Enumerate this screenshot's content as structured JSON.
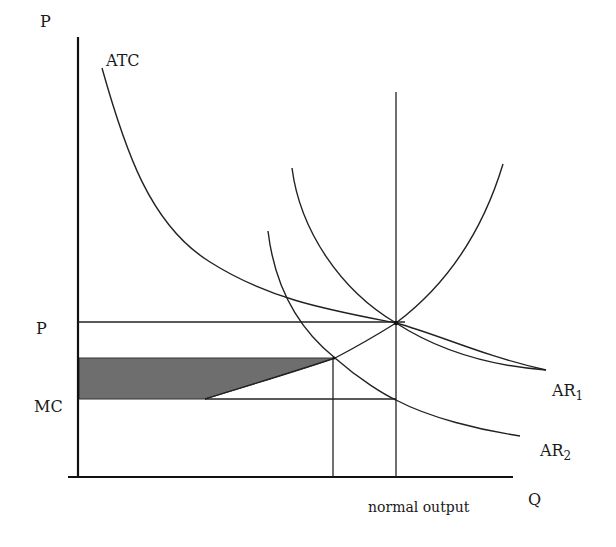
{
  "diagram": {
    "title": "",
    "colors": {
      "background": "#ffffff",
      "lines": "#222222",
      "shade": "#6e6e6e"
    },
    "axes": {
      "y_label": "P",
      "x_label": "Q"
    },
    "labels": {
      "atc": "ATC",
      "price": "P",
      "mc": "MC",
      "ar1_main": "AR",
      "ar1_sub": "1",
      "ar2_main": "AR",
      "ar2_sub": "2",
      "normal_output": "normal output"
    },
    "nodes": [
      {
        "id": "atc",
        "label": "ATC",
        "type": "curve"
      },
      {
        "id": "mc",
        "label": "MC",
        "type": "curve"
      },
      {
        "id": "ar1",
        "label": "AR1",
        "type": "curve"
      },
      {
        "id": "ar2",
        "label": "AR2",
        "type": "curve"
      },
      {
        "id": "p_level",
        "label": "P",
        "type": "horizontal-line"
      },
      {
        "id": "mc_level",
        "label": "MC",
        "type": "horizontal-line"
      },
      {
        "id": "normal_output",
        "label": "normal output",
        "type": "vertical-line"
      },
      {
        "id": "shaded_area",
        "label": "",
        "type": "shaded-region"
      }
    ]
  }
}
